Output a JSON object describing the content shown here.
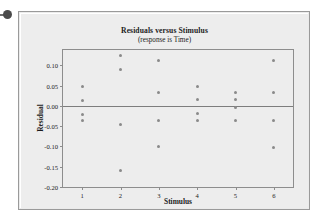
{
  "decoration": {
    "bullet_name": "bullet-dot"
  },
  "chart_data": {
    "type": "scatter",
    "title": "Residuals versus Stimulus",
    "subtitle": "(response is Time)",
    "xlabel": "Stimulus",
    "ylabel": "Residual",
    "xlim": [
      0.5,
      6.5
    ],
    "ylim": [
      -0.2,
      0.1375
    ],
    "grid": false,
    "legend": "none",
    "reference_line": 0.0,
    "xticks": [
      "1",
      "2",
      "3",
      "4",
      "5",
      "6"
    ],
    "xtick_values": [
      1,
      2,
      3,
      4,
      5,
      6
    ],
    "yticks": [
      "0.10",
      "0.05",
      "0.00",
      "-0.05",
      "-0.10",
      "-0.15",
      "-0.20"
    ],
    "ytick_values": [
      0.1,
      0.05,
      0.0,
      -0.05,
      -0.1,
      -0.15,
      -0.2
    ],
    "points": [
      {
        "x": 1,
        "y": 0.047
      },
      {
        "x": 1,
        "y": 0.012
      },
      {
        "x": 1,
        "y": -0.021
      },
      {
        "x": 1,
        "y": -0.036
      },
      {
        "x": 2,
        "y": 0.125
      },
      {
        "x": 2,
        "y": 0.089
      },
      {
        "x": 2,
        "y": -0.045
      },
      {
        "x": 2,
        "y": -0.16
      },
      {
        "x": 3,
        "y": 0.112
      },
      {
        "x": 3,
        "y": 0.032
      },
      {
        "x": 3,
        "y": -0.037
      },
      {
        "x": 3,
        "y": -0.101
      },
      {
        "x": 4,
        "y": 0.047
      },
      {
        "x": 4,
        "y": 0.015
      },
      {
        "x": 4,
        "y": -0.018
      },
      {
        "x": 4,
        "y": -0.036
      },
      {
        "x": 5,
        "y": 0.032
      },
      {
        "x": 5,
        "y": 0.015
      },
      {
        "x": 5,
        "y": -0.003
      },
      {
        "x": 5,
        "y": -0.036
      },
      {
        "x": 6,
        "y": 0.112
      },
      {
        "x": 6,
        "y": 0.032
      },
      {
        "x": 6,
        "y": -0.036
      },
      {
        "x": 6,
        "y": -0.103
      }
    ]
  },
  "colors": {
    "panel_background": "#ededed",
    "panel_border": "#9a9a9a",
    "marker": "#8a8a8a",
    "axis": "#8d8d8d",
    "text": "#1b1b1b"
  }
}
